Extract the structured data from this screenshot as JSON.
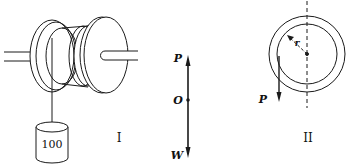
{
  "figure_I": {
    "caption": "I",
    "weight_label": "100",
    "force_diagram": {
      "top_label": "P",
      "center_label": "O",
      "bottom_label": "W"
    }
  },
  "figure_II": {
    "caption": "II",
    "radius_label": "r",
    "force_label": "P"
  },
  "colors": {
    "line": "#1a1a1a",
    "background": "#ffffff"
  }
}
